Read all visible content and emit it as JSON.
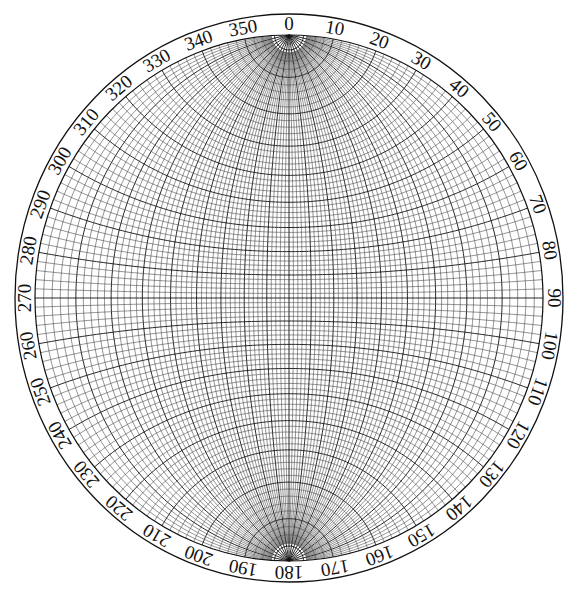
{
  "diagram": {
    "type": "wulff-net",
    "grid_interval_deg": 2,
    "major_interval_deg": 10,
    "center": [
      289,
      298
    ],
    "outer_radius": [
      274,
      284
    ],
    "grid_radius": [
      254,
      263
    ],
    "pole_cap_radius": 15,
    "colors": {
      "background": "#ffffff",
      "line": "#111111",
      "minor_line": "#3a3a3a"
    }
  },
  "azimuth_labels": [
    "0",
    "10",
    "20",
    "30",
    "40",
    "50",
    "60",
    "70",
    "80",
    "90",
    "100",
    "110",
    "120",
    "130",
    "140",
    "150",
    "160",
    "170",
    "180",
    "190",
    "200",
    "210",
    "220",
    "230",
    "240",
    "250",
    "260",
    "270",
    "280",
    "290",
    "300",
    "310",
    "320",
    "330",
    "340",
    "350"
  ]
}
